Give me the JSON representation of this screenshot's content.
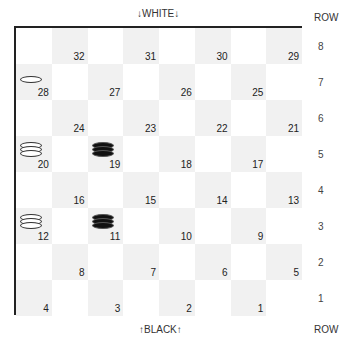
{
  "top_label": "↓WHITE↓",
  "bottom_label": "↑BLACK↑",
  "row_header": "ROW",
  "row_footer": "ROW",
  "rows": [
    "8",
    "7",
    "6",
    "5",
    "4",
    "3",
    "2",
    "1"
  ],
  "squares": [
    {
      "num": "32",
      "row": 0,
      "col": 1
    },
    {
      "num": "31",
      "row": 0,
      "col": 3
    },
    {
      "num": "30",
      "row": 0,
      "col": 5
    },
    {
      "num": "29",
      "row": 0,
      "col": 7
    },
    {
      "num": "28",
      "row": 1,
      "col": 0
    },
    {
      "num": "27",
      "row": 1,
      "col": 2
    },
    {
      "num": "26",
      "row": 1,
      "col": 4
    },
    {
      "num": "25",
      "row": 1,
      "col": 6
    },
    {
      "num": "24",
      "row": 2,
      "col": 1
    },
    {
      "num": "23",
      "row": 2,
      "col": 3
    },
    {
      "num": "22",
      "row": 2,
      "col": 5
    },
    {
      "num": "21",
      "row": 2,
      "col": 7
    },
    {
      "num": "20",
      "row": 3,
      "col": 0
    },
    {
      "num": "19",
      "row": 3,
      "col": 2
    },
    {
      "num": "18",
      "row": 3,
      "col": 4
    },
    {
      "num": "17",
      "row": 3,
      "col": 6
    },
    {
      "num": "16",
      "row": 4,
      "col": 1
    },
    {
      "num": "15",
      "row": 4,
      "col": 3
    },
    {
      "num": "14",
      "row": 4,
      "col": 5
    },
    {
      "num": "13",
      "row": 4,
      "col": 7
    },
    {
      "num": "12",
      "row": 5,
      "col": 0
    },
    {
      "num": "11",
      "row": 5,
      "col": 2
    },
    {
      "num": "10",
      "row": 5,
      "col": 4
    },
    {
      "num": "9",
      "row": 5,
      "col": 6
    },
    {
      "num": "8",
      "row": 6,
      "col": 1
    },
    {
      "num": "7",
      "row": 6,
      "col": 3
    },
    {
      "num": "6",
      "row": 6,
      "col": 5
    },
    {
      "num": "5",
      "row": 6,
      "col": 7
    },
    {
      "num": "4",
      "row": 7,
      "col": 0
    },
    {
      "num": "3",
      "row": 7,
      "col": 2
    },
    {
      "num": "2",
      "row": 7,
      "col": 4
    },
    {
      "num": "1",
      "row": 7,
      "col": 6
    }
  ],
  "pieces": [
    {
      "square": "28",
      "color": "white",
      "stack": 1
    },
    {
      "square": "20",
      "color": "white",
      "stack": 3
    },
    {
      "square": "19",
      "color": "black",
      "stack": 3
    },
    {
      "square": "12",
      "color": "white",
      "stack": 3
    },
    {
      "square": "11",
      "color": "black",
      "stack": 3
    }
  ]
}
